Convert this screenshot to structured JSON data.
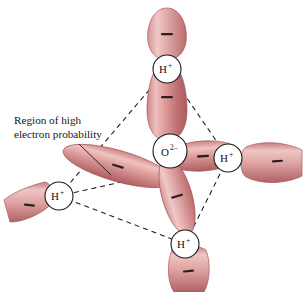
{
  "figure": {
    "background_color": "#ffffff",
    "type": "molecular-orbital-diagram"
  },
  "annotation": {
    "name": "region-of-high-electron-probability",
    "line1": "Region of high",
    "line2": "electron probability",
    "text_color": "#161616",
    "leader_line_color": "#1a1a1a"
  },
  "center_ion": {
    "name": "oxide-ion",
    "symbol": "O",
    "charge": "2–",
    "circle_fill": "#ffffff",
    "circle_stroke": "#1a1a1a",
    "cx": 170,
    "cy": 151,
    "r": 17
  },
  "hydrogen_ions": [
    {
      "name": "hydrogen-ion-top",
      "symbol": "H",
      "charge": "+",
      "cx": 167,
      "cy": 69,
      "r": 14
    },
    {
      "name": "hydrogen-ion-right",
      "symbol": "H",
      "charge": "+",
      "cx": 228,
      "cy": 158,
      "r": 14
    },
    {
      "name": "hydrogen-ion-lower-left",
      "symbol": "H",
      "charge": "+",
      "cx": 59,
      "cy": 196,
      "r": 14
    },
    {
      "name": "hydrogen-ion-bottom",
      "symbol": "H",
      "charge": "+",
      "cx": 185,
      "cy": 244,
      "r": 14
    }
  ],
  "tetrahedron": {
    "name": "tetrahedral-bond-frame",
    "edge_color": "#1a1a1a",
    "dash_pattern": "5,4",
    "vertices": [
      {
        "name": "vertex-top",
        "x": 167,
        "y": 69
      },
      {
        "name": "vertex-right",
        "x": 228,
        "y": 158
      },
      {
        "name": "vertex-lower-left",
        "x": 59,
        "y": 196
      },
      {
        "name": "vertex-bottom",
        "x": 185,
        "y": 244
      }
    ]
  },
  "orbital_lobes": {
    "charge_sign": "–",
    "sign_color": "#2a2020",
    "fill_light": "#f0c3c0",
    "fill_mid": "#d98c8c",
    "fill_dark": "#b95f60",
    "outline": "#a85658",
    "items": [
      {
        "name": "lobe-inner-top",
        "position": "inner-top"
      },
      {
        "name": "lobe-inner-left",
        "position": "inner-left"
      },
      {
        "name": "lobe-inner-right",
        "position": "inner-right"
      },
      {
        "name": "lobe-inner-bottom",
        "position": "inner-bottom"
      },
      {
        "name": "lobe-outer-top",
        "position": "outer-top"
      },
      {
        "name": "lobe-outer-right",
        "position": "outer-right"
      },
      {
        "name": "lobe-outer-lower-left",
        "position": "outer-lower-left"
      },
      {
        "name": "lobe-outer-bottom",
        "position": "outer-bottom"
      }
    ]
  }
}
